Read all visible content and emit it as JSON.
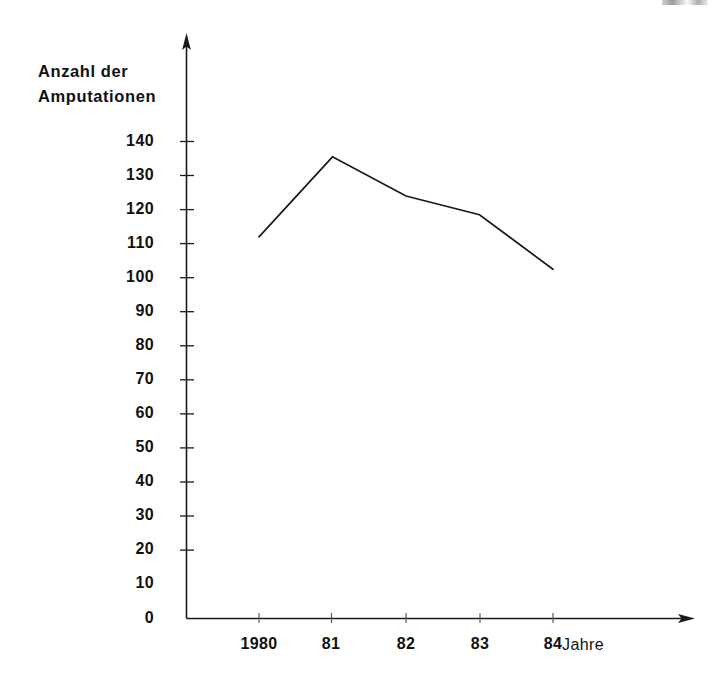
{
  "figure": {
    "y_axis_title_line1": "Anzahl der",
    "y_axis_title_line2": "Amputationen",
    "x_axis_title": "Jahre",
    "line_color": "#1a1a1a",
    "axis_color": "#1a1a1a",
    "background_color": "#ffffff"
  },
  "chart_data": {
    "type": "line",
    "title": "",
    "subtitle": "",
    "xlabel": "Jahre",
    "ylabel": "Anzahl der Amputationen",
    "categories": [
      "1980",
      "81",
      "82",
      "83",
      "84"
    ],
    "x_tick_labels": [
      "1980",
      "81",
      "82",
      "83",
      "84"
    ],
    "values": [
      112,
      135.5,
      124,
      118.5,
      102.5
    ],
    "series": [
      {
        "name": "Anzahl der Amputationen",
        "values": [
          112,
          135.5,
          124,
          118.5,
          102.5
        ]
      }
    ],
    "ylim": [
      0,
      140
    ],
    "xlim": [
      1980,
      1984
    ],
    "y_tick_labels": [
      "0",
      "10",
      "20",
      "30",
      "40",
      "50",
      "60",
      "70",
      "80",
      "90",
      "100",
      "110",
      "120",
      "130",
      "140"
    ],
    "y_ticks": [
      0,
      10,
      20,
      30,
      40,
      50,
      60,
      70,
      80,
      90,
      100,
      110,
      120,
      130,
      140
    ],
    "y_tick_step": 10,
    "grid": false,
    "legend": false,
    "legend_position": "none",
    "markers": false,
    "axis_arrows": {
      "y_axis": "up",
      "x_axis": "right"
    },
    "annotations": []
  }
}
